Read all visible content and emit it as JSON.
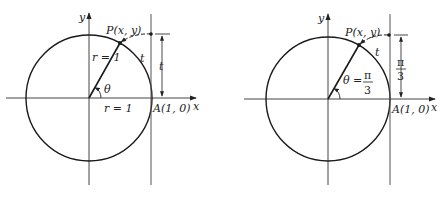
{
  "figures": [
    {
      "name": "general-arc",
      "axis_x_label": "x",
      "axis_y_label": "y",
      "point_label": "P(x, y)",
      "arc_label": "t",
      "tangent_length_label": "t",
      "radius_label": "r = 1",
      "x_radius_label": "r = 1",
      "angle_label": "θ",
      "anchor_label": "A(1, 0)"
    },
    {
      "name": "pi-over-three-arc",
      "axis_x_label": "x",
      "axis_y_label": "y",
      "point_label": "P(x, y)",
      "arc_label": "t",
      "tangent_length_num": "π",
      "tangent_length_den": "3",
      "angle_prefix": "θ =",
      "angle_num": "π",
      "angle_den": "3",
      "anchor_label": "A(1, 0)"
    }
  ],
  "colors": {
    "line": "#1a1a1a",
    "background": "#ffffff"
  }
}
